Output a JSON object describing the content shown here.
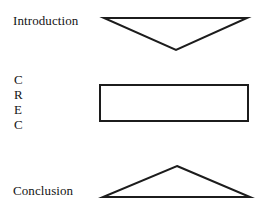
{
  "diagram": {
    "background_color": "#ffffff",
    "stroke_color": "#1c1c1c",
    "sections": [
      {
        "label": "Introduction",
        "shape": "inverted-triangle",
        "meaning": "broad to narrow"
      },
      {
        "label": "CREC",
        "shape": "rectangle",
        "meaning": "body paragraphs of even width"
      },
      {
        "label": "Conclusion",
        "shape": "triangle",
        "meaning": "narrow to broad"
      }
    ],
    "labels": {
      "introduction": "Introduction",
      "conclusion": "Conclusion"
    },
    "crec_letters": [
      "C",
      "R",
      "E",
      "C"
    ]
  }
}
